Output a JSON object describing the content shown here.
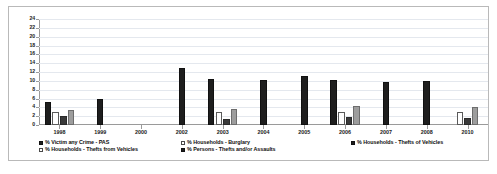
{
  "chart_data": {
    "type": "bar",
    "title": "",
    "xlabel": "",
    "ylabel": "",
    "ylim": [
      0,
      24
    ],
    "ytick_step": 2,
    "grid": true,
    "legend_position": "bottom",
    "yticks": [
      "24",
      "22",
      "20",
      "18",
      "16",
      "14",
      "12",
      "10",
      "8",
      "6",
      "4",
      "2",
      "0"
    ],
    "categories": [
      "1998",
      "1999",
      "2000",
      "2002",
      "2003",
      "2004",
      "2005",
      "2006",
      "2007",
      "2008",
      "2010"
    ],
    "series": [
      {
        "name": "% Victim any Crime - PAS",
        "swatch": "s-victim",
        "bar": "b-theftfrom",
        "values": [
          5.3,
          6.0,
          0,
          12.8,
          10.5,
          10.2,
          11.0,
          10.2,
          9.8,
          10.0,
          0
        ]
      },
      {
        "name": "% Households - Burglary",
        "swatch": "s-burglary",
        "bar": "b-victim",
        "values": [
          3.0,
          0,
          0,
          0,
          3.0,
          0,
          0,
          3.0,
          0,
          0,
          3.0
        ]
      },
      {
        "name": "% Households - Thefts of Vehicles",
        "swatch": "s-theftof",
        "bar": "b-burglary",
        "values": [
          2.0,
          0,
          0,
          0,
          1.3,
          0,
          0,
          1.8,
          0,
          0,
          1.7
        ]
      },
      {
        "name": "% Households - Thefts from Vehicles",
        "swatch": "s-theftfrom",
        "bar": "b-theftof",
        "values": [
          3.3,
          0,
          0,
          0,
          3.6,
          0,
          0,
          4.3,
          0,
          0,
          4.0
        ]
      },
      {
        "name": "% Persons - Thefts and/or Assaults",
        "swatch": "s-persons",
        "bar": "b-persons",
        "values": [
          0,
          0,
          0,
          0,
          0,
          0,
          0,
          0,
          0,
          0,
          0
        ]
      }
    ]
  },
  "legend": {
    "row1": [
      "% Victim any Crime - PAS",
      "% Households - Burglary",
      "% Households - Thefts of Vehicles"
    ],
    "row2": [
      "% Households - Thefts from Vehicles",
      "% Persons - Thefts and/or Assaults"
    ]
  }
}
